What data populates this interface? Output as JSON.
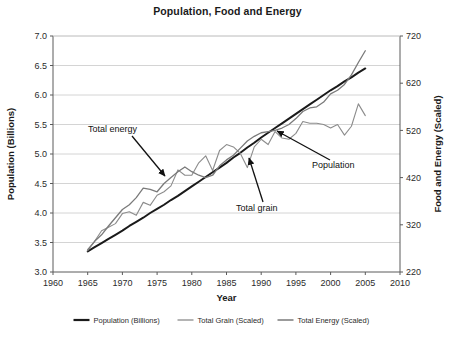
{
  "chart_data": {
    "type": "line",
    "title": "Population, Food and Energy",
    "xlabel": "Year",
    "ylabel": "Population (Billions)",
    "y2label": "Food and Energy (Scaled)",
    "xlim": [
      1960,
      2010
    ],
    "ylim": [
      3.0,
      7.0
    ],
    "y2lim": [
      220,
      720
    ],
    "xticks": [
      1960,
      1965,
      1970,
      1975,
      1980,
      1985,
      1990,
      1995,
      2000,
      2005,
      2010
    ],
    "yticks": [
      3.0,
      3.5,
      4.0,
      4.5,
      5.0,
      5.5,
      6.0,
      6.5,
      7.0
    ],
    "y2ticks": [
      220,
      320,
      420,
      520,
      620,
      720
    ],
    "grid": true,
    "legend_position": "bottom",
    "x": [
      1965,
      1966,
      1967,
      1968,
      1969,
      1970,
      1971,
      1972,
      1973,
      1974,
      1975,
      1976,
      1977,
      1978,
      1979,
      1980,
      1981,
      1982,
      1983,
      1984,
      1985,
      1986,
      1987,
      1988,
      1989,
      1990,
      1991,
      1992,
      1993,
      1994,
      1995,
      1996,
      1997,
      1998,
      1999,
      2000,
      2001,
      2002,
      2003,
      2004,
      2005
    ],
    "series": [
      {
        "name": "Population (Billions)",
        "color": "#1a1a1a",
        "width": 2.0,
        "units": "billions",
        "values": [
          3.35,
          3.42,
          3.49,
          3.56,
          3.63,
          3.7,
          3.78,
          3.85,
          3.92,
          4.0,
          4.07,
          4.14,
          4.22,
          4.29,
          4.37,
          4.45,
          4.53,
          4.61,
          4.69,
          4.77,
          4.85,
          4.94,
          5.02,
          5.11,
          5.19,
          5.28,
          5.36,
          5.44,
          5.52,
          5.6,
          5.68,
          5.76,
          5.84,
          5.92,
          6.0,
          6.08,
          6.15,
          6.23,
          6.3,
          6.38,
          6.45
        ]
      },
      {
        "name": "Total Grain (Scaled)",
        "color": "#8c8c8c",
        "width": 1.1,
        "units": "scaled",
        "values": [
          3.36,
          3.52,
          3.7,
          3.76,
          3.82,
          3.99,
          4.02,
          3.96,
          4.18,
          4.13,
          4.3,
          4.36,
          4.46,
          4.73,
          4.64,
          4.64,
          4.85,
          4.97,
          4.72,
          5.06,
          5.16,
          5.12,
          5.01,
          4.77,
          5.12,
          5.25,
          5.16,
          5.38,
          5.27,
          5.25,
          5.35,
          5.55,
          5.52,
          5.52,
          5.5,
          5.44,
          5.5,
          5.32,
          5.47,
          5.85,
          5.65
        ]
      },
      {
        "name": "Total Energy (Scaled)",
        "color": "#7a7a7a",
        "width": 1.3,
        "units": "scaled",
        "values": [
          3.38,
          3.52,
          3.63,
          3.78,
          3.92,
          4.06,
          4.14,
          4.26,
          4.42,
          4.4,
          4.36,
          4.5,
          4.6,
          4.7,
          4.78,
          4.7,
          4.64,
          4.6,
          4.64,
          4.8,
          4.9,
          4.98,
          5.1,
          5.22,
          5.3,
          5.36,
          5.38,
          5.4,
          5.44,
          5.5,
          5.6,
          5.72,
          5.78,
          5.8,
          5.88,
          6.02,
          6.08,
          6.18,
          6.34,
          6.55,
          6.75
        ]
      }
    ],
    "annotations": [
      {
        "text": "Total energy",
        "label_x": 88,
        "label_y": 132,
        "arrow_from_x": 132,
        "arrow_from_y": 136,
        "arrow_to_x": 165,
        "arrow_to_y": 176
      },
      {
        "text": "Total grain",
        "label_x": 236,
        "label_y": 211,
        "arrow_from_x": 263,
        "arrow_from_y": 202,
        "arrow_to_x": 249,
        "arrow_to_y": 158
      },
      {
        "text": "Population",
        "label_x": 312,
        "label_y": 168,
        "arrow_from_x": 330,
        "arrow_from_y": 160,
        "arrow_to_x": 277,
        "arrow_to_y": 131
      }
    ]
  }
}
